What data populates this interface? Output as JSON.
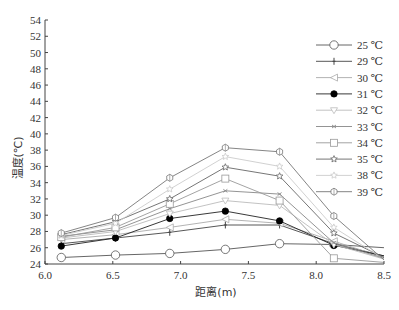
{
  "chart_data": {
    "type": "line",
    "title": "",
    "xlabel": "距离(m)",
    "ylabel": "温度(℃)",
    "xlim": [
      6.0,
      8.5
    ],
    "ylim": [
      24,
      54
    ],
    "xticks": [
      "6.0",
      "6.5",
      "7.0",
      "7.5",
      "8.0",
      "8.5"
    ],
    "yticks": [
      "24",
      "26",
      "28",
      "30",
      "32",
      "34",
      "36",
      "38",
      "40",
      "42",
      "44",
      "46",
      "48",
      "50",
      "52",
      "54"
    ],
    "grid": false,
    "legend_position": "upper right",
    "x": [
      6.12,
      6.52,
      6.92,
      7.33,
      7.73,
      8.13,
      8.5
    ],
    "series": [
      {
        "name": "25 ℃",
        "marker": "circle-open",
        "color": "#555555",
        "values": [
          24.8,
          25.1,
          25.3,
          25.8,
          26.5,
          26.4,
          26.0
        ]
      },
      {
        "name": "29 ℃",
        "marker": "plus",
        "color": "#444444",
        "values": [
          26.5,
          27.2,
          27.9,
          28.8,
          28.8,
          26.5,
          25.0
        ]
      },
      {
        "name": "30 ℃",
        "marker": "triangle-left-open",
        "color": "#aaaaaa",
        "values": [
          27.0,
          27.6,
          28.5,
          29.5,
          29.0,
          26.8,
          24.8
        ]
      },
      {
        "name": "31 ℃",
        "marker": "circle-filled",
        "color": "#222222",
        "values": [
          26.2,
          27.2,
          29.6,
          30.5,
          29.3,
          26.3,
          25.0
        ]
      },
      {
        "name": "32 ℃",
        "marker": "triangle-down-open",
        "color": "#bbbbbb",
        "values": [
          27.2,
          28.0,
          30.2,
          31.8,
          31.2,
          26.4,
          24.6
        ]
      },
      {
        "name": "33 ℃",
        "marker": "x",
        "color": "#888888",
        "values": [
          27.4,
          28.2,
          30.8,
          33.0,
          32.6,
          26.6,
          24.7
        ]
      },
      {
        "name": "34 ℃",
        "marker": "square-open",
        "color": "#999999",
        "values": [
          27.3,
          28.5,
          31.4,
          34.5,
          31.8,
          24.7,
          24.2
        ]
      },
      {
        "name": "35 ℃",
        "marker": "star-open",
        "color": "#666666",
        "values": [
          27.6,
          29.2,
          32.0,
          35.9,
          34.8,
          27.8,
          24.8
        ]
      },
      {
        "name": "38 ℃",
        "marker": "star-open",
        "color": "#cccccc",
        "values": [
          27.5,
          29.0,
          33.2,
          37.2,
          36.0,
          28.5,
          24.6
        ]
      },
      {
        "name": "39 ℃",
        "marker": "hexagon-open",
        "color": "#777777",
        "values": [
          27.8,
          29.7,
          34.6,
          38.3,
          37.8,
          29.9,
          24.5
        ]
      }
    ]
  },
  "legend": {
    "items": [
      "25 ℃",
      "29 ℃",
      "30 ℃",
      "31 ℃",
      "32 ℃",
      "33 ℃",
      "34 ℃",
      "35 ℃",
      "38 ℃",
      "39 ℃"
    ]
  },
  "axes": {
    "xlabel": "距离(m)",
    "ylabel": "温度(℃)"
  }
}
